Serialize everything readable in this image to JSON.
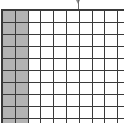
{
  "figure": {
    "title": "",
    "type": "grid-diagram"
  },
  "chart_data": {
    "type": "heatmap",
    "title": "",
    "xlabel": "",
    "ylabel": "",
    "rows": 10,
    "columns": 10,
    "grid": true,
    "legend": "none",
    "shaded_columns": [
      1,
      2
    ],
    "shaded_cell_count": 20,
    "total_cell_count": 100,
    "categories": [
      "1",
      "2",
      "3",
      "4",
      "5",
      "6",
      "7",
      "8",
      "9",
      "10"
    ],
    "row_labels": [
      "1",
      "2",
      "3",
      "4",
      "5",
      "6",
      "7",
      "8",
      "9",
      "10"
    ],
    "values": [
      [
        1,
        1,
        0,
        0,
        0,
        0,
        0,
        0,
        0,
        0
      ],
      [
        1,
        1,
        0,
        0,
        0,
        0,
        0,
        0,
        0,
        0
      ],
      [
        1,
        1,
        0,
        0,
        0,
        0,
        0,
        0,
        0,
        0
      ],
      [
        1,
        1,
        0,
        0,
        0,
        0,
        0,
        0,
        0,
        0
      ],
      [
        1,
        1,
        0,
        0,
        0,
        0,
        0,
        0,
        0,
        0
      ],
      [
        1,
        1,
        0,
        0,
        0,
        0,
        0,
        0,
        0,
        0
      ],
      [
        1,
        1,
        0,
        0,
        0,
        0,
        0,
        0,
        0,
        0
      ],
      [
        1,
        1,
        0,
        0,
        0,
        0,
        0,
        0,
        0,
        0
      ],
      [
        1,
        1,
        0,
        0,
        0,
        0,
        0,
        0,
        0,
        0
      ],
      [
        1,
        1,
        0,
        0,
        0,
        0,
        0,
        0,
        0,
        0
      ]
    ]
  },
  "colors": {
    "grid_line": "#3a3a3a",
    "cell_empty": "#ffffff",
    "cell_shaded": "#b3b3b3",
    "cursor": "#6b6b6b",
    "background": "#ffffff"
  },
  "cursor": {
    "icon": "pointer-tick-icon",
    "x": 76,
    "y": 0
  }
}
